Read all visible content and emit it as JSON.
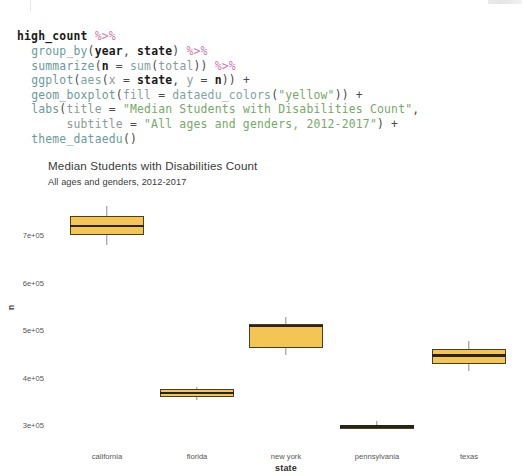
{
  "code": {
    "language": "R",
    "lines": [
      [
        {
          "t": "high_count",
          "c": "tok-ident"
        },
        {
          "t": " ",
          "c": "tok-plain"
        },
        {
          "t": "%>%",
          "c": "tok-op"
        }
      ],
      [
        {
          "t": "  ",
          "c": "tok-plain"
        },
        {
          "t": "group_by",
          "c": "tok-fn"
        },
        {
          "t": "(",
          "c": "tok-punct"
        },
        {
          "t": "year",
          "c": "tok-argb"
        },
        {
          "t": ", ",
          "c": "tok-punct"
        },
        {
          "t": "state",
          "c": "tok-argb"
        },
        {
          "t": ") ",
          "c": "tok-punct"
        },
        {
          "t": "%>%",
          "c": "tok-op"
        }
      ],
      [
        {
          "t": "  ",
          "c": "tok-plain"
        },
        {
          "t": "summarize",
          "c": "tok-fn"
        },
        {
          "t": "(",
          "c": "tok-punct"
        },
        {
          "t": "n",
          "c": "tok-argb"
        },
        {
          "t": " = ",
          "c": "tok-punct"
        },
        {
          "t": "sum",
          "c": "tok-fn2"
        },
        {
          "t": "(",
          "c": "tok-punct"
        },
        {
          "t": "total",
          "c": "tok-arg"
        },
        {
          "t": ")) ",
          "c": "tok-punct"
        },
        {
          "t": "%>%",
          "c": "tok-op"
        }
      ],
      [
        {
          "t": "  ",
          "c": "tok-plain"
        },
        {
          "t": "ggplot",
          "c": "tok-fn"
        },
        {
          "t": "(",
          "c": "tok-punct"
        },
        {
          "t": "aes",
          "c": "tok-fn2"
        },
        {
          "t": "(",
          "c": "tok-punct"
        },
        {
          "t": "x",
          "c": "tok-arg"
        },
        {
          "t": " = ",
          "c": "tok-punct"
        },
        {
          "t": "state",
          "c": "tok-argb"
        },
        {
          "t": ", ",
          "c": "tok-punct"
        },
        {
          "t": "y",
          "c": "tok-arg"
        },
        {
          "t": " = ",
          "c": "tok-punct"
        },
        {
          "t": "n",
          "c": "tok-argb"
        },
        {
          "t": ")) +",
          "c": "tok-punct"
        }
      ],
      [
        {
          "t": "  ",
          "c": "tok-plain"
        },
        {
          "t": "geom_boxplot",
          "c": "tok-fn"
        },
        {
          "t": "(",
          "c": "tok-punct"
        },
        {
          "t": "fill",
          "c": "tok-arg"
        },
        {
          "t": " = ",
          "c": "tok-punct"
        },
        {
          "t": "dataedu_colors",
          "c": "tok-fn2"
        },
        {
          "t": "(",
          "c": "tok-punct"
        },
        {
          "t": "\"yellow\"",
          "c": "tok-str"
        },
        {
          "t": ")) +",
          "c": "tok-punct"
        }
      ],
      [
        {
          "t": "  ",
          "c": "tok-plain"
        },
        {
          "t": "labs",
          "c": "tok-fn"
        },
        {
          "t": "(",
          "c": "tok-punct"
        },
        {
          "t": "title",
          "c": "tok-arg"
        },
        {
          "t": " = ",
          "c": "tok-punct"
        },
        {
          "t": "\"Median Students with Disabilities Count\"",
          "c": "tok-str"
        },
        {
          "t": ",",
          "c": "tok-punct"
        }
      ],
      [
        {
          "t": "       ",
          "c": "tok-plain"
        },
        {
          "t": "subtitle",
          "c": "tok-arg"
        },
        {
          "t": " = ",
          "c": "tok-punct"
        },
        {
          "t": "\"All ages and genders, 2012-2017\"",
          "c": "tok-str"
        },
        {
          "t": ") +",
          "c": "tok-punct"
        }
      ],
      [
        {
          "t": "  ",
          "c": "tok-plain"
        },
        {
          "t": "theme_dataedu",
          "c": "tok-fn"
        },
        {
          "t": "()",
          "c": "tok-punct"
        }
      ]
    ]
  },
  "chart_data": {
    "type": "boxplot",
    "title": "Median Students with Disabilities Count",
    "subtitle": "All ages and genders, 2012-2017",
    "xlabel": "state",
    "ylabel": "n",
    "categories": [
      "california",
      "florida",
      "new york",
      "pennsylvania",
      "texas"
    ],
    "yticks": [
      "3e+05",
      "4e+05",
      "5e+05",
      "6e+05",
      "7e+05"
    ],
    "ytick_values": [
      300000,
      400000,
      500000,
      600000,
      700000
    ],
    "ylim": [
      262000,
      742000
    ],
    "grid": false,
    "legend": "none",
    "fill_color": "#f2c555",
    "border_color": "#4a3f22",
    "whisker_color": "#8d8d8d",
    "boxes": [
      {
        "category": "california",
        "whisker_low": 678000,
        "q1": 700000,
        "median": 719000,
        "q3": 741000,
        "whisker_high": 762000
      },
      {
        "category": "florida",
        "whisker_low": 353000,
        "q1": 360000,
        "median": 368000,
        "q3": 375000,
        "whisker_high": 381000
      },
      {
        "category": "new york",
        "whisker_low": 447000,
        "q1": 462000,
        "median": 509000,
        "q3": 512000,
        "whisker_high": 527000
      },
      {
        "category": "pennsylvania",
        "whisker_low": 291000,
        "q1": 295000,
        "median": 297000,
        "q3": 300000,
        "whisker_high": 308000
      },
      {
        "category": "texas",
        "whisker_low": 413000,
        "q1": 429000,
        "median": 446000,
        "q3": 459000,
        "whisker_high": 476000
      }
    ]
  },
  "geometry": {
    "y_pixel_at_7e05": 235,
    "y_pixel_at_3e05": 425,
    "px_per_unit": 0.000475,
    "category_centers_px": [
      107,
      197,
      286,
      377,
      469
    ],
    "box_half_width_px": 37
  }
}
